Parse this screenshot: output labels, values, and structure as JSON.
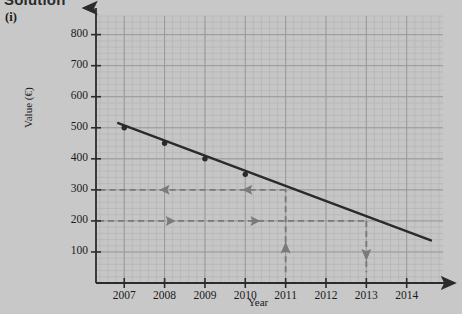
{
  "header": {
    "solution_label": "Solution",
    "part_label": "(i)"
  },
  "colors": {
    "background": "#c8c8c8",
    "plot_background": "#c6c6c6",
    "grid_minor": "#b4b4b4",
    "grid_major": "#9a9a9a",
    "axis": "#2b2b2b",
    "data_line": "#2a2a2a",
    "guide_line": "#7a7a7a",
    "text": "#1a1a1a"
  },
  "chart_data": {
    "type": "line",
    "title": "",
    "xlabel": "Year",
    "ylabel": "Value (€)",
    "xlim": [
      2006.3,
      2014.9
    ],
    "ylim": [
      0,
      860
    ],
    "grid": true,
    "grid_minor_step_x": 0.2,
    "grid_minor_step_y": 20,
    "grid_major_step_x": 1,
    "grid_major_step_y": 100,
    "legend": "none",
    "x_ticks": [
      2007,
      2008,
      2009,
      2010,
      2011,
      2012,
      2013,
      2014
    ],
    "x_tick_labels": [
      "2007",
      "2008",
      "2009",
      "2010",
      "2011",
      "2012",
      "2013",
      "2014"
    ],
    "y_ticks": [
      100,
      200,
      300,
      400,
      500,
      600,
      700,
      800
    ],
    "y_tick_labels": [
      "100",
      "200",
      "300",
      "400",
      "500",
      "600",
      "700",
      "800"
    ],
    "series": [
      {
        "name": "Value",
        "marker": "circle",
        "x": [
          2007,
          2008,
          2009,
          2010,
          2011,
          2012,
          2013,
          2014
        ],
        "values": [
          500,
          450,
          400,
          350,
          300,
          250,
          200,
          150
        ],
        "marked_points_x": [
          2007,
          2008,
          2009,
          2010
        ],
        "marked_points_y": [
          500,
          450,
          400,
          350
        ],
        "line_start": [
          2006.85,
          515
        ],
        "line_end": [
          2014.6,
          137
        ]
      }
    ],
    "annotations": [
      {
        "name": "horizontal-guide-300",
        "type": "dashed-horizontal-arrow",
        "y": 300,
        "x_from": 2011,
        "x_to": 2006.35,
        "direction": "left",
        "arrow_positions_x": [
          2010.1,
          2008.05
        ]
      },
      {
        "name": "horizontal-guide-200",
        "type": "dashed-horizontal-arrow",
        "y": 200,
        "x_from": 2006.35,
        "x_to": 2013,
        "direction": "right",
        "arrow_positions_x": [
          2008.1,
          2010.2
        ]
      },
      {
        "name": "vertical-guide-2011",
        "type": "dashed-vertical-arrow",
        "x": 2011,
        "y_from": 35,
        "y_to": 300,
        "direction": "up",
        "arrow_position_y": 105
      },
      {
        "name": "vertical-guide-2013",
        "type": "dashed-vertical-arrow",
        "x": 2013,
        "y_from": 200,
        "y_to": 35,
        "direction": "down",
        "arrow_position_y": 100
      }
    ]
  }
}
